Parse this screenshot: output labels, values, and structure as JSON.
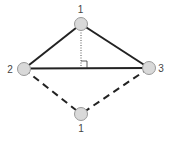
{
  "diagram": {
    "nodes": [
      {
        "id": "top",
        "label": "1",
        "x": 81,
        "y": 24
      },
      {
        "id": "left",
        "label": "2",
        "x": 24,
        "y": 69
      },
      {
        "id": "right",
        "label": "3",
        "x": 149,
        "y": 68
      },
      {
        "id": "bottom",
        "label": "1",
        "x": 81,
        "y": 114
      }
    ],
    "edges": [
      {
        "from": "top",
        "to": "left",
        "style": "solid"
      },
      {
        "from": "top",
        "to": "right",
        "style": "solid"
      },
      {
        "from": "left",
        "to": "right",
        "style": "solid"
      },
      {
        "from": "left",
        "to": "bottom",
        "style": "dashed"
      },
      {
        "from": "right",
        "to": "bottom",
        "style": "dashed"
      },
      {
        "from": "top",
        "to": "base",
        "style": "dotted",
        "note": "altitude with right-angle marker"
      }
    ],
    "colors": {
      "node_fill": "#d9d9d9",
      "node_stroke": "#9a9a9a",
      "edge": "#222222",
      "label": "#444444"
    }
  }
}
